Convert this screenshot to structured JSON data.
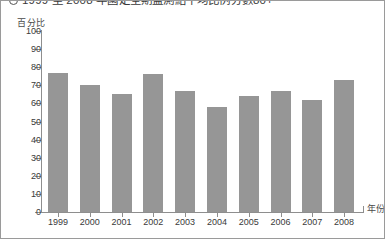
{
  "title": {
    "marker": "circle-marker",
    "text": "1999 至 2008 年國定全期監測結千均比例分數80+"
  },
  "axes": {
    "y_label": "百分比",
    "x_label": "年份",
    "y_ticks": [
      "100",
      "90",
      "80",
      "70",
      "60",
      "50",
      "40",
      "30",
      "20",
      "10",
      "0"
    ]
  },
  "colors": {
    "bar": "#969696",
    "axis": "#8e8e8e",
    "text": "#3a3a3a",
    "background": "#ffffff"
  },
  "chart_data": {
    "type": "bar",
    "title": "1999 至 2008 年國定全期監測結千均比例分數80+",
    "categories": [
      "1999",
      "2000",
      "2001",
      "2002",
      "2003",
      "2004",
      "2005",
      "2006",
      "2007",
      "2008"
    ],
    "values": [
      77,
      70,
      65,
      76,
      67,
      58,
      64,
      67,
      62,
      73
    ],
    "xlabel": "年份",
    "ylabel": "百分比",
    "ylim": [
      0,
      100
    ],
    "ytick_step": 10,
    "grid": false,
    "legend": "none",
    "series_color": "#969696"
  }
}
